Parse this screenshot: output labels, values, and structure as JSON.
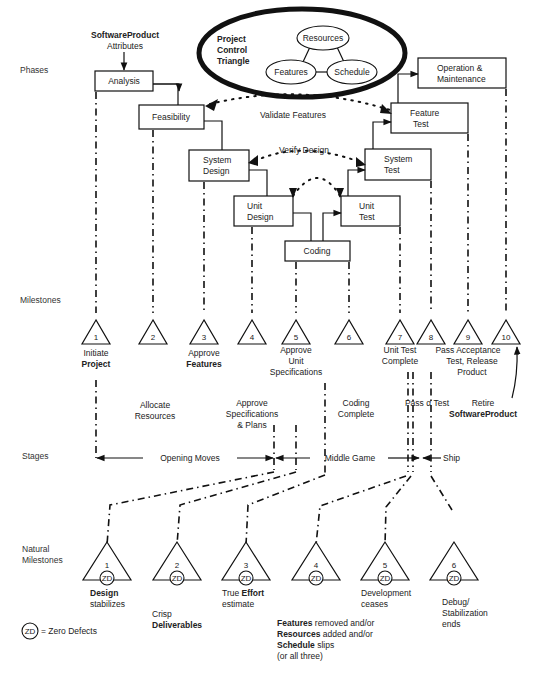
{
  "row_labels": {
    "phases": "Phases",
    "milestones": "Milestones",
    "stages": "Stages",
    "natural_milestones_1": "Natural",
    "natural_milestones_2": "Milestones"
  },
  "product_attributes": {
    "title": "SoftwareProduct",
    "subtitle": "Attributes"
  },
  "control_triangle": {
    "title_1": "Project",
    "title_2": "Control",
    "title_3": "Triangle",
    "nodes": [
      "Resources",
      "Features",
      "Schedule"
    ]
  },
  "phases": {
    "analysis": "Analysis",
    "feasibility": "Feasibility",
    "system_design_1": "System",
    "system_design_2": "Design",
    "unit_design_1": "Unit",
    "unit_design_2": "Design",
    "coding": "Coding",
    "unit_test_1": "Unit",
    "unit_test_2": "Test",
    "system_test_1": "System",
    "system_test_2": "Test",
    "feature_test_1": "Feature",
    "feature_test_2": "Test",
    "operation_1": "Operation &",
    "operation_2": "Maintenance"
  },
  "feedback": {
    "validate": "Validate Features",
    "verify": "Verify Design"
  },
  "milestones": [
    {
      "num": "1",
      "l1": "Initiate",
      "l2": "Project",
      "l2_bold": true
    },
    {
      "num": "2"
    },
    {
      "num": "3",
      "l1": "Approve",
      "l2": "Features",
      "l2_bold": true
    },
    {
      "num": "4"
    },
    {
      "num": "5",
      "l1": "Approve",
      "l2": "Unit",
      "l3": "Specifications"
    },
    {
      "num": "6"
    },
    {
      "num": "7",
      "l1": "Unit Test",
      "l2": "Complete"
    },
    {
      "num": "8"
    },
    {
      "num": "9",
      "l1": "Pass Acceptance",
      "l2": "Test, Release",
      "l3": "Product"
    },
    {
      "num": "10"
    }
  ],
  "events": {
    "allocate_1": "Allocate",
    "allocate_2": "Resources",
    "approve_spec_1": "Approve",
    "approve_spec_2": "Specifications",
    "approve_spec_3": "& Plans",
    "coding_complete_1": "Coding",
    "coding_complete_2": "Complete",
    "pass_alpha": "Pass α Test",
    "retire_1": "Retire",
    "retire_2": "SoftwareProduct"
  },
  "stages": {
    "opening": "Opening Moves",
    "middle": "Middle Game",
    "ship": "Ship"
  },
  "natural_milestones": [
    {
      "num": "1",
      "badge": "ZD",
      "l1": "Design",
      "l1_bold": true,
      "l2": "stabilizes"
    },
    {
      "num": "2",
      "badge": "ZD",
      "l1": "Crisp",
      "l2": "Deliverables",
      "l2_bold": true
    },
    {
      "num": "3",
      "badge": "ZD",
      "l1a": "True ",
      "l1b": "Effort",
      "l2": "estimate"
    },
    {
      "num": "4",
      "badge": "ZD",
      "lines": [
        {
          "bold": "Features",
          "rest": " removed and/or"
        },
        {
          "bold": "Resources",
          "rest": " added and/or"
        },
        {
          "bold": "Schedule",
          "rest": " slips"
        },
        {
          "bold": "",
          "rest": "(or all three)"
        }
      ]
    },
    {
      "num": "5",
      "badge": "ZD",
      "l1": "Development",
      "l2": "ceases"
    },
    {
      "num": "6",
      "badge": "ZD",
      "l1": "Debug/",
      "l2": "Stabilization",
      "l3": "ends"
    }
  ],
  "legend": {
    "badge": "ZD",
    "text": "= Zero Defects"
  }
}
